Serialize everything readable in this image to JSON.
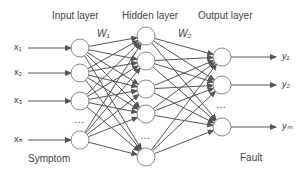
{
  "title_labels": {
    "input_layer": "Input layer",
    "hidden_layer": "Hidden layer",
    "output_layer": "Output layer"
  },
  "weights": {
    "w1": "W₁",
    "w2": "W₂"
  },
  "inputs": [
    "x₁",
    "x₂",
    "x₃",
    "xₙ"
  ],
  "outputs": [
    "y₁",
    "y₂",
    "yₘ"
  ],
  "ellipsis": "…",
  "captions": {
    "left": "Symptom",
    "right": "Fault"
  },
  "layout": {
    "input_nodes": [
      [
        80,
        48
      ],
      [
        80,
        73
      ],
      [
        80,
        101
      ],
      [
        80,
        140
      ]
    ],
    "hidden_nodes": [
      [
        146,
        36
      ],
      [
        146,
        61
      ],
      [
        146,
        89
      ],
      [
        146,
        114
      ],
      [
        146,
        157
      ]
    ],
    "output_nodes": [
      [
        222,
        57
      ],
      [
        222,
        85
      ],
      [
        222,
        127
      ]
    ],
    "node_radius": 9
  }
}
